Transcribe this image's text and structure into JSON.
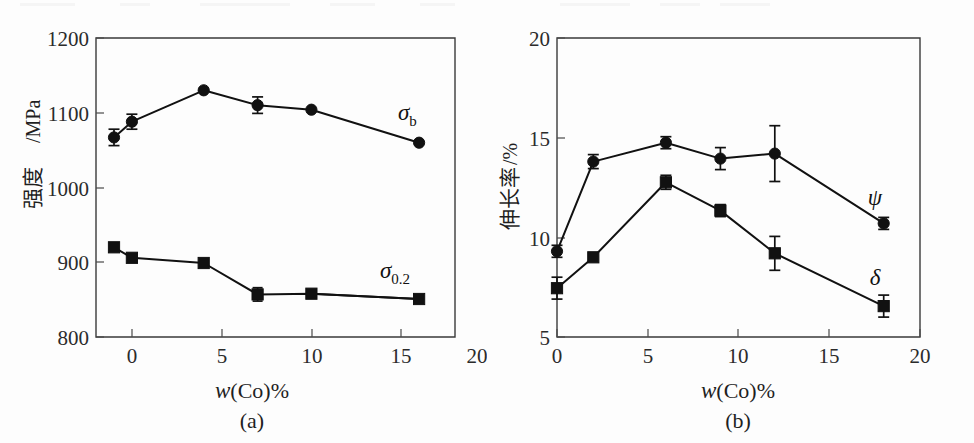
{
  "figure": {
    "background_color": "#fdfdfd",
    "ink_color": "#111111",
    "panel_count": 2
  },
  "panel_a": {
    "caption": "(a)",
    "xlabel_symbol": "w",
    "xlabel_rest": "(Co)%",
    "ylabel_cjk": "强度",
    "ylabel_unit": "/MPa",
    "x_ticks": [
      "0",
      "5",
      "10",
      "15",
      "20"
    ],
    "y_ticks": [
      "800",
      "900",
      "1000",
      "1100",
      "1200"
    ],
    "series_label_sigma_b": "σ",
    "series_label_sigma_b_sub": "b",
    "series_label_sigma_02": "σ",
    "series_label_sigma_02_sub": "0.2"
  },
  "panel_b": {
    "caption": "(b)",
    "xlabel_symbol": "w",
    "xlabel_rest": "(Co)%",
    "ylabel_cjk": "伸长率",
    "ylabel_unit": "/%",
    "x_ticks": [
      "0",
      "5",
      "10",
      "15",
      "20"
    ],
    "y_ticks": [
      "5",
      "10",
      "15",
      "20"
    ],
    "series_label_psi": "ψ",
    "series_label_delta": "δ"
  },
  "chart_data": [
    {
      "type": "line",
      "panel": "a",
      "title": "",
      "caption": "(a)",
      "xlabel": "w(Co)%",
      "ylabel": "强度/MPa",
      "xlim": [
        0,
        20
      ],
      "ylim": [
        800,
        1200
      ],
      "xticks": [
        0,
        5,
        10,
        15,
        20
      ],
      "yticks": [
        800,
        900,
        1000,
        1100,
        1200
      ],
      "grid": false,
      "legend": "inline-labels-at-right",
      "x": [
        0,
        2,
        6,
        9,
        12,
        18
      ],
      "series": [
        {
          "name": "σb",
          "label": "σ_b",
          "marker": "circle",
          "values": [
            1067,
            1088,
            1130,
            1110,
            1104,
            1060
          ],
          "errors": [
            11,
            10,
            3,
            11,
            2,
            3
          ]
        },
        {
          "name": "σ0.2",
          "label": "σ_0.2",
          "marker": "square",
          "values": [
            920,
            906,
            899,
            857,
            858,
            851
          ],
          "errors": [
            3,
            3,
            2,
            9,
            2,
            2
          ]
        }
      ]
    },
    {
      "type": "line",
      "panel": "b",
      "title": "",
      "caption": "(b)",
      "xlabel": "w(Co)%",
      "ylabel": "伸长率/%",
      "xlim": [
        0,
        20
      ],
      "ylim": [
        5,
        20
      ],
      "xticks": [
        0,
        5,
        10,
        15,
        20
      ],
      "yticks": [
        5,
        10,
        15,
        20
      ],
      "grid": false,
      "legend": "inline-labels-at-right",
      "x": [
        0,
        2,
        6,
        9,
        12,
        18
      ],
      "series": [
        {
          "name": "ψ",
          "label": "ψ",
          "marker": "circle",
          "values": [
            9.3,
            13.8,
            14.75,
            13.95,
            14.2,
            10.7
          ],
          "errors": [
            0.3,
            0.35,
            0.3,
            0.55,
            1.4,
            0.3
          ]
        },
        {
          "name": "δ",
          "label": "δ",
          "marker": "square",
          "values": [
            7.45,
            9.0,
            12.75,
            11.35,
            9.2,
            6.55
          ],
          "errors": [
            0.55,
            0.12,
            0.35,
            0.3,
            0.85,
            0.55
          ]
        }
      ]
    }
  ]
}
